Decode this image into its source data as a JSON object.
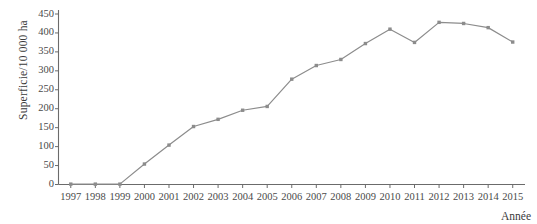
{
  "chart_data": {
    "type": "line",
    "title": "",
    "xlabel": "Année",
    "ylabel": "Superficie/10 000 ha",
    "x": [
      1997,
      1998,
      1999,
      2000,
      2001,
      2002,
      2003,
      2004,
      2005,
      2006,
      2007,
      2008,
      2009,
      2010,
      2011,
      2012,
      2013,
      2014,
      2015
    ],
    "categories": [
      "1997",
      "1998",
      "1999",
      "2000",
      "2001",
      "2002",
      "2003",
      "2004",
      "2005",
      "2006",
      "2007",
      "2008",
      "2009",
      "2010",
      "2011",
      "2012",
      "2013",
      "2014",
      "2015"
    ],
    "values": [
      1,
      1,
      1,
      54,
      104,
      153,
      172,
      196,
      206,
      278,
      314,
      330,
      372,
      410,
      375,
      428,
      425,
      414,
      376
    ],
    "series": [
      {
        "name": "Superficie",
        "values": [
          1,
          1,
          1,
          54,
          104,
          153,
          172,
          196,
          206,
          278,
          314,
          330,
          372,
          410,
          375,
          428,
          425,
          414,
          376
        ]
      }
    ],
    "ylim": [
      0,
      450
    ],
    "yticks": [
      0,
      50,
      100,
      150,
      200,
      250,
      300,
      350,
      400,
      450
    ],
    "ytick_labels": [
      "0",
      "50",
      "100",
      "150",
      "200",
      "250",
      "300",
      "350",
      "400",
      "450"
    ],
    "xlim": [
      1997,
      2015
    ],
    "grid": false,
    "legend": "none",
    "line_color": "#8c8c8c",
    "marker_color": "#8c8c8c",
    "marker": "square",
    "axis_color": "#6b6b6b"
  },
  "axes": {
    "y_title": "Superficie/10 000 ha",
    "x_title": "Année"
  }
}
